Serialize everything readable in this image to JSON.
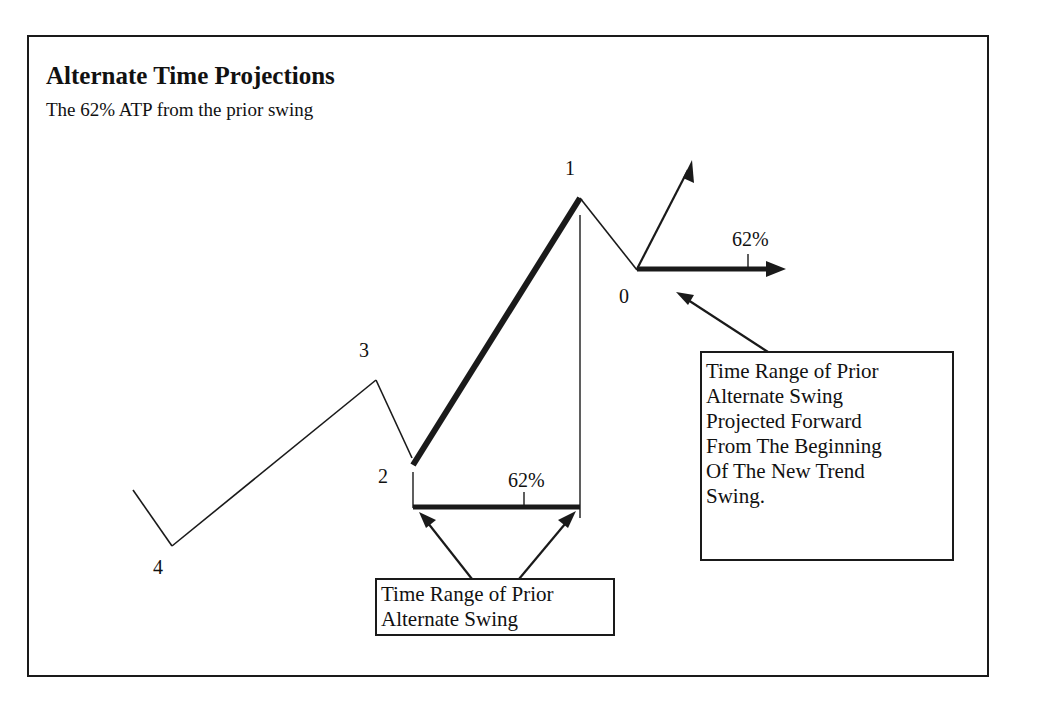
{
  "title": "Alternate Time Projections",
  "subtitle": "The 62% ATP from the prior swing",
  "points": {
    "p4": "4",
    "p3": "3",
    "p2": "2",
    "p1": "1",
    "p0": "0"
  },
  "percent_labels": {
    "lower": "62%",
    "upper": "62%"
  },
  "callouts": {
    "lower": {
      "lines": [
        "Time Range of Prior",
        "Alternate Swing"
      ]
    },
    "right": {
      "lines": [
        "Time Range of Prior",
        "Alternate Swing",
        "Projected Forward",
        "From The Beginning",
        "Of The New Trend",
        "Swing."
      ]
    }
  },
  "colors": {
    "ink": "#1a1a1a",
    "background": "#ffffff"
  }
}
